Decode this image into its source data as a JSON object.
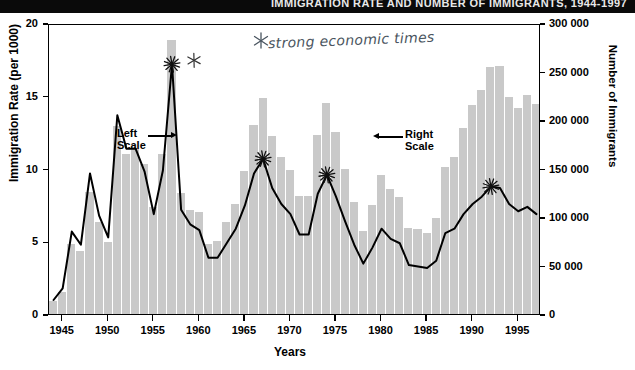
{
  "banner": {
    "title": "IMMIGRATION RATE AND NUMBER OF IMMIGRANTS, 1944-1997"
  },
  "annotations": {
    "handwritten_note": "strong economic times",
    "left_scale_label_line1": "Left",
    "left_scale_label_line2": "Scale",
    "right_scale_label_line1": "Right",
    "right_scale_label_line2": "Scale",
    "asterisk_glyph": "star-marker",
    "marked_years": [
      1957,
      1967,
      1974,
      1992
    ]
  },
  "colors": {
    "bar_fill": "#c9c9c9",
    "bar_separator": "#ffffff",
    "line": "#000000",
    "banner_bg": "#0a0a0a",
    "ink": "#4a5560"
  },
  "chart_data": {
    "type": "bar",
    "title": "Immigration Rate and Number of Immigrants",
    "xlabel": "Years",
    "ylabel": "Immigration Rate (per 1000)",
    "y2label": "Number of Immigrants",
    "xlim": [
      1944,
      1997
    ],
    "ylim": [
      0,
      20
    ],
    "y2lim": [
      0,
      300000
    ],
    "grid": false,
    "legend": "in-plot callouts",
    "xticks": [
      1945,
      1950,
      1955,
      1960,
      1965,
      1970,
      1975,
      1980,
      1985,
      1990,
      1995
    ],
    "xticklabels": [
      "1945",
      "1950",
      "1955",
      "1960",
      "1965",
      "1970",
      "1975",
      "1980",
      "1985",
      "1990",
      "1995"
    ],
    "yticks": [
      0,
      5,
      10,
      15,
      20
    ],
    "yticklabels": [
      "0",
      "5",
      "10",
      "15",
      "20"
    ],
    "y2ticks": [
      0,
      50000,
      100000,
      150000,
      200000,
      250000,
      300000
    ],
    "y2ticklabels": [
      "0",
      "50 000",
      "100 000",
      "150 000",
      "200 000",
      "250 000",
      "300 000"
    ],
    "x": [
      1944,
      1945,
      1946,
      1947,
      1948,
      1949,
      1950,
      1951,
      1952,
      1953,
      1954,
      1955,
      1956,
      1957,
      1958,
      1959,
      1960,
      1961,
      1962,
      1963,
      1964,
      1965,
      1966,
      1967,
      1968,
      1969,
      1970,
      1971,
      1972,
      1973,
      1974,
      1975,
      1976,
      1977,
      1978,
      1979,
      1980,
      1981,
      1982,
      1983,
      1984,
      1985,
      1986,
      1987,
      1988,
      1989,
      1990,
      1991,
      1992,
      1993,
      1994,
      1995,
      1996,
      1997
    ],
    "series": [
      {
        "name": "Number of Immigrants",
        "axis": "right",
        "type": "bar",
        "values": [
          13000,
          23000,
          72000,
          65000,
          126000,
          95000,
          74000,
          194000,
          165000,
          170000,
          155000,
          110000,
          165000,
          282000,
          125000,
          107000,
          105000,
          72000,
          75000,
          95000,
          113000,
          147000,
          195000,
          223000,
          184000,
          162000,
          148000,
          122000,
          122000,
          185000,
          218000,
          188000,
          150000,
          115000,
          86000,
          112000,
          143000,
          129000,
          121000,
          89000,
          88000,
          84000,
          99000,
          152000,
          162000,
          192000,
          215000,
          231000,
          255000,
          256000,
          224000,
          212000,
          226000,
          216000
        ]
      },
      {
        "name": "Immigration Rate (per 1000)",
        "axis": "left",
        "type": "line",
        "values": [
          1.1,
          1.9,
          5.8,
          4.9,
          9.8,
          6.9,
          5.4,
          13.8,
          11.5,
          11.5,
          9.9,
          7.0,
          10.0,
          17.3,
          7.3,
          6.3,
          5.9,
          4.0,
          4.0,
          5.0,
          6.0,
          7.6,
          9.8,
          10.8,
          8.8,
          7.7,
          7.0,
          5.6,
          5.6,
          8.4,
          9.7,
          8.2,
          6.5,
          4.9,
          3.6,
          4.7,
          6.0,
          5.3,
          5.0,
          3.5,
          3.4,
          3.3,
          3.8,
          5.7,
          6.0,
          7.0,
          7.7,
          8.2,
          8.9,
          8.8,
          7.7,
          7.2,
          7.5,
          7.0
        ]
      }
    ]
  }
}
